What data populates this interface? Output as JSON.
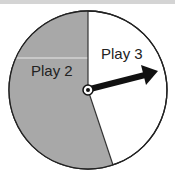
{
  "spinner": {
    "sections": [
      {
        "label": "Play 2",
        "color": "#a8a8a8",
        "fraction_estimate": 0.55
      },
      {
        "label": "Play 3",
        "color": "#ffffff",
        "fraction_estimate": 0.45
      }
    ],
    "arrow": {
      "color": "#111111",
      "points_to": "Play 3"
    }
  }
}
